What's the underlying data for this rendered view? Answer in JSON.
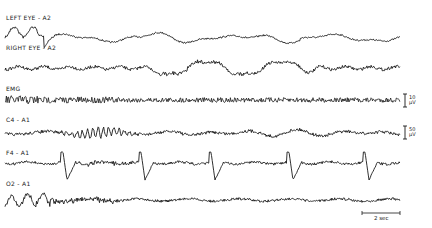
{
  "channels": [
    {
      "id": "left-eye",
      "label": "LEFT EYE - A2",
      "label_x": 6,
      "label_y": 14,
      "baseline_y": 38
    },
    {
      "id": "right-eye",
      "label": "RIGHT EYE - A2",
      "label_x": 6,
      "label_y": 44,
      "baseline_y": 68
    },
    {
      "id": "emg",
      "label": "EMG",
      "label_x": 6,
      "label_y": 85,
      "baseline_y": 100
    },
    {
      "id": "c4-a1",
      "label": "C4 - A1",
      "label_x": 6,
      "label_y": 116,
      "baseline_y": 133
    },
    {
      "id": "f4-a1",
      "label": "F4 - A1",
      "label_x": 6,
      "label_y": 149,
      "baseline_y": 163
    },
    {
      "id": "o2-a1",
      "label": "O2 - A1",
      "label_x": 6,
      "label_y": 180,
      "baseline_y": 200
    }
  ],
  "calibration": [
    {
      "id": "emg-cal",
      "value": "10",
      "unit": "µV",
      "x": 405,
      "y_top": 94,
      "y_bottom": 107
    },
    {
      "id": "c4-cal",
      "value": "50",
      "unit": "µV",
      "x": 405,
      "y_top": 126,
      "y_bottom": 139
    }
  ],
  "time_scale": {
    "label": "2 sec",
    "x_start": 362,
    "x_end": 400,
    "y": 213
  },
  "f4_spike_positions": [
    62,
    140,
    210,
    288,
    364
  ],
  "colors": {
    "trace": "#1a1a1a",
    "background": "#ffffff"
  }
}
